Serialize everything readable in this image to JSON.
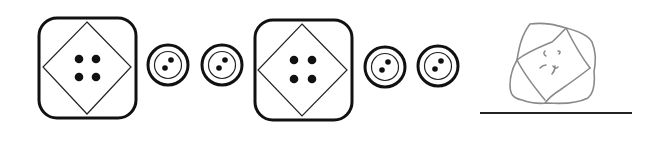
{
  "worksheet": {
    "task": "pattern-completion",
    "pattern": [
      {
        "type": "large-square-button",
        "holes": 4
      },
      {
        "type": "small-round-button",
        "holes": 2
      },
      {
        "type": "small-round-button",
        "holes": 2
      },
      {
        "type": "large-square-button",
        "holes": 4
      },
      {
        "type": "small-round-button",
        "holes": 2
      },
      {
        "type": "small-round-button",
        "holes": 2
      }
    ],
    "answer": {
      "kind": "handwritten-drawing",
      "description": "pencil sketch of a square button with diamond and marks"
    },
    "colors": {
      "ink": "#111111",
      "pencil": "#8a8a8a",
      "background": "#ffffff"
    }
  }
}
